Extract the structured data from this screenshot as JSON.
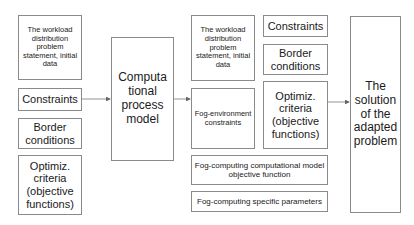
{
  "diagram": {
    "left_column": [
      {
        "id": "workload-statement",
        "label": "The workload distribution problem statement, initial data"
      },
      {
        "id": "constraints",
        "label": "Constraints"
      },
      {
        "id": "border-conditions",
        "label": "Border conditions"
      },
      {
        "id": "optimization-criteria",
        "label": "Optimiz. criteria (objective functions)"
      }
    ],
    "center": {
      "id": "computational-process-model",
      "label": "Computa tional process model"
    },
    "right_group": {
      "col_a": [
        {
          "id": "workload-statement-2",
          "label": "The workload distribution problem statement, initial data"
        },
        {
          "id": "fog-environment-constraints",
          "label": "Fog-environment constraints"
        }
      ],
      "col_b": [
        {
          "id": "constraints-2",
          "label": "Constraints"
        },
        {
          "id": "border-conditions-2",
          "label": "Border conditions"
        },
        {
          "id": "optimization-criteria-2",
          "label": "Optimiz. criteria (objective functions)"
        }
      ],
      "wide": [
        {
          "id": "fog-objective-function",
          "label": "Fog-computing computational model objective function"
        },
        {
          "id": "fog-specific-parameters",
          "label": "Fog-computing specific parameters"
        }
      ]
    },
    "output": {
      "id": "solution",
      "label": "The solution of the adapted problem"
    },
    "edges": [
      {
        "from": "constraints",
        "to": "computational-process-model"
      },
      {
        "from": "computational-process-model",
        "to": "fog-environment-constraints"
      },
      {
        "from": "optimization-criteria-2",
        "to": "solution"
      }
    ]
  }
}
